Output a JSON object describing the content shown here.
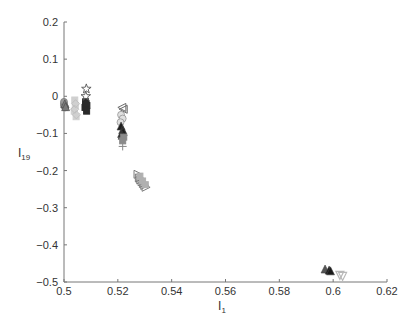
{
  "chart_data": {
    "type": "scatter",
    "title": "",
    "xlabel": "I",
    "xlabel_sub": "1",
    "ylabel": "I",
    "ylabel_sub": "19",
    "xlim": [
      0.5,
      0.62
    ],
    "ylim": [
      -0.5,
      0.2
    ],
    "xticks": [
      "0.5",
      "0.52",
      "0.54",
      "0.56",
      "0.58",
      "0.6",
      "0.62"
    ],
    "yticks": [
      "0.2",
      "0.1",
      "0",
      "-0.1",
      "-0.2",
      "-0.3",
      "-0.4",
      "-0.5"
    ],
    "grid": false,
    "legend": null,
    "series": [
      {
        "name": "cluster-a",
        "marker": "circle",
        "color": "#9a9a9a",
        "points": [
          [
            0.5,
            -0.02
          ],
          [
            0.5,
            -0.025
          ],
          [
            0.5005,
            -0.03
          ],
          [
            0.5,
            -0.015
          ]
        ]
      },
      {
        "name": "cluster-a-tri",
        "marker": "triangle-up",
        "color": "#7a7a7a",
        "points": [
          [
            0.5003,
            -0.02
          ],
          [
            0.5006,
            -0.028
          ]
        ]
      },
      {
        "name": "cluster-b",
        "marker": "square",
        "color": "#d0d0d0",
        "points": [
          [
            0.504,
            -0.01
          ],
          [
            0.5042,
            -0.025
          ],
          [
            0.5038,
            -0.04
          ],
          [
            0.5045,
            -0.055
          ]
        ]
      },
      {
        "name": "cluster-b-diamond",
        "marker": "diamond",
        "color": "#c0c0c0",
        "points": [
          [
            0.5043,
            -0.02
          ],
          [
            0.504,
            -0.035
          ],
          [
            0.5046,
            -0.05
          ]
        ]
      },
      {
        "name": "cluster-c-dark",
        "marker": "square",
        "color": "#2a2a2a",
        "points": [
          [
            0.508,
            -0.015
          ],
          [
            0.5085,
            -0.025
          ],
          [
            0.5078,
            -0.03
          ],
          [
            0.5084,
            -0.04
          ],
          [
            0.5082,
            -0.02
          ]
        ]
      },
      {
        "name": "cluster-c-star",
        "marker": "star",
        "color": "#555555",
        "points": [
          [
            0.5083,
            0.02
          ],
          [
            0.5081,
            0.0
          ]
        ]
      },
      {
        "name": "cluster-d-tri",
        "marker": "triangle-left",
        "color": "#6a6a6a",
        "points": [
          [
            0.5215,
            -0.03
          ],
          [
            0.522,
            -0.035
          ]
        ]
      },
      {
        "name": "cluster-d-light",
        "marker": "circle",
        "color": "#e0e0e0",
        "points": [
          [
            0.5212,
            -0.05
          ],
          [
            0.5218,
            -0.06
          ],
          [
            0.521,
            -0.07
          ]
        ]
      },
      {
        "name": "cluster-d-dark",
        "marker": "triangle-up",
        "color": "#1e1e1e",
        "points": [
          [
            0.5212,
            -0.08
          ],
          [
            0.5218,
            -0.09
          ],
          [
            0.5214,
            -0.1
          ],
          [
            0.522,
            -0.095
          ],
          [
            0.5216,
            -0.105
          ]
        ]
      },
      {
        "name": "cluster-d-sq",
        "marker": "square",
        "color": "#8a8a8a",
        "points": [
          [
            0.5222,
            -0.11
          ],
          [
            0.5218,
            -0.12
          ]
        ]
      },
      {
        "name": "cluster-d-plus",
        "marker": "plus",
        "color": "#888888",
        "points": [
          [
            0.5218,
            -0.135
          ]
        ]
      },
      {
        "name": "cluster-e",
        "marker": "triangle-right",
        "color": "#7a7a7a",
        "points": [
          [
            0.5275,
            -0.21
          ],
          [
            0.528,
            -0.22
          ],
          [
            0.5285,
            -0.225
          ],
          [
            0.529,
            -0.23
          ],
          [
            0.5295,
            -0.235
          ],
          [
            0.53,
            -0.24
          ],
          [
            0.5305,
            -0.245
          ]
        ]
      },
      {
        "name": "cluster-e-sq",
        "marker": "square",
        "color": "#b0b0b0",
        "points": [
          [
            0.5282,
            -0.215
          ],
          [
            0.5292,
            -0.228
          ],
          [
            0.5302,
            -0.238
          ]
        ]
      },
      {
        "name": "cluster-f-tri-outline",
        "marker": "triangle-up",
        "color": "#555555",
        "points": [
          [
            0.597,
            -0.465
          ]
        ]
      },
      {
        "name": "cluster-f-dark",
        "marker": "triangle-up",
        "color": "#1a1a1a",
        "points": [
          [
            0.5985,
            -0.468
          ],
          [
            0.599,
            -0.47
          ]
        ]
      },
      {
        "name": "cluster-f-down",
        "marker": "triangle-down",
        "color": "#b8b8b8",
        "points": [
          [
            0.6025,
            -0.482
          ],
          [
            0.6035,
            -0.485
          ]
        ]
      }
    ]
  }
}
